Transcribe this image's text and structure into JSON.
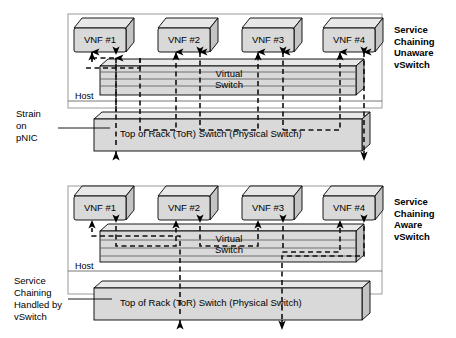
{
  "panels": [
    {
      "id": "top",
      "side_label": "Service\nChaining\nUnaware\nvSwitch",
      "side_label_lines": [
        "Service",
        "Chaining",
        "Unaware",
        "vSwitch"
      ],
      "host_label": "Host",
      "vswitch_label_lines": [
        "Virtual",
        "Switch"
      ],
      "tor_label": "Top of Rack (ToR) Switch (Physical Switch)",
      "vnfs": [
        {
          "label": "VNF #1"
        },
        {
          "label": "VNF #2"
        },
        {
          "label": "VNF #3"
        },
        {
          "label": "VNF #4"
        }
      ],
      "annotation": {
        "text_lines": [
          "Strain",
          "on",
          "pNIC"
        ],
        "text": "Strain on pNIC"
      }
    },
    {
      "id": "bottom",
      "side_label": "Service\nChaining\nAware\nvSwitch",
      "side_label_lines": [
        "Service",
        "Chaining",
        "Aware",
        "vSwitch"
      ],
      "host_label": "Host",
      "vswitch_label_lines": [
        "Virtual",
        "Switch"
      ],
      "tor_label": "Top of Rack (ToR) Switch (Physical Switch)",
      "vnfs": [
        {
          "label": "VNF #1"
        },
        {
          "label": "VNF #2"
        },
        {
          "label": "VNF #3"
        },
        {
          "label": "VNF #4"
        }
      ],
      "annotation": {
        "text_lines": [
          "Service",
          "Chaining",
          "Handled by",
          "vSwitch"
        ],
        "text": "Service Chaining Handled by vSwitch"
      }
    }
  ],
  "colors": {
    "box_face": "#d9d9d9",
    "box_top": "#e8e8e8",
    "box_side": "#c4c4c4",
    "stroke": "#000000",
    "panel_border": "#9a9a9a",
    "flow_dashed": "#1a1a1a",
    "text": "#000000"
  },
  "legend": {
    "dashed_meaning": "traffic flow path",
    "solid_meaning": "physical/virtual link"
  }
}
